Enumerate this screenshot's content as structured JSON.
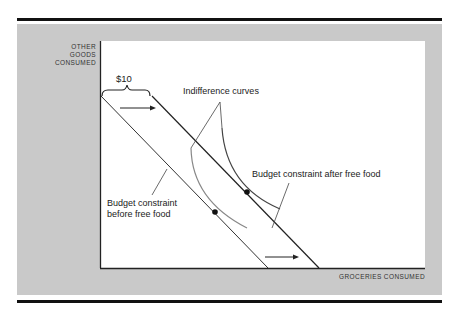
{
  "diagram": {
    "y_axis_label": [
      "OTHER",
      "GOODS",
      "CONSUMED"
    ],
    "x_axis_label": "GROCERIES CONSUMED",
    "brace_label": "$10",
    "indifference_label": "Indifference curves",
    "budget_after_label": "Budget constraint after free food",
    "budget_before_label_line1": "Budget constraint",
    "budget_before_label_line2": "before free food",
    "colors": {
      "panel": "#c9c9c9",
      "plot": "#ffffff",
      "line": "#222222",
      "curve_low": "#888888",
      "curve_high": "#444444"
    }
  }
}
